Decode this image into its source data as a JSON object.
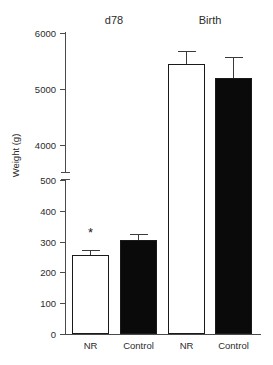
{
  "chart_data": {
    "type": "bar",
    "title": "",
    "xlabel": "",
    "ylabel": "Weight (g)",
    "grid": false,
    "legend": "none",
    "broken_axis": true,
    "axis_segments": [
      {
        "name": "lower",
        "range": [
          0,
          500
        ],
        "ticks": [
          0,
          100,
          200,
          300,
          400,
          500
        ]
      },
      {
        "name": "upper",
        "range": [
          4000,
          6000
        ],
        "ticks": [
          4000,
          5000,
          6000
        ]
      }
    ],
    "ytick_labels_lower": [
      "0",
      "100",
      "200",
      "300",
      "400",
      "500"
    ],
    "ytick_labels_upper": [
      "4000",
      "5000",
      "6000"
    ],
    "groups": [
      "d78",
      "Birth"
    ],
    "categories": [
      "NR",
      "Control",
      "NR",
      "Control"
    ],
    "values": [
      255,
      305,
      5450,
      5230
    ],
    "errors": [
      8,
      12,
      130,
      220
    ],
    "fills": [
      "open",
      "solid",
      "open",
      "solid"
    ],
    "annotations": [
      {
        "label": "*",
        "bar_index": 0
      }
    ]
  },
  "axis": {
    "y_label": "Weight (g)",
    "ticks_upper": [
      {
        "value": "6000",
        "y": 33
      },
      {
        "value": "5000",
        "y": 89
      },
      {
        "value": "4000",
        "y": 145
      }
    ],
    "ticks_lower": [
      {
        "value": "500",
        "y": 180
      },
      {
        "value": "400",
        "y": 211
      },
      {
        "value": "300",
        "y": 242
      },
      {
        "value": "200",
        "y": 272
      },
      {
        "value": "100",
        "y": 303
      },
      {
        "value": "0",
        "y": 334
      }
    ]
  },
  "groups": [
    {
      "label": "d78"
    },
    {
      "label": "Birth"
    }
  ],
  "bars": [
    {
      "category": "NR",
      "group": "d78",
      "value": 255,
      "error": 8,
      "fill": "open",
      "left": 72,
      "width": 37,
      "top": 255,
      "height": 79,
      "err_cap_top": 250,
      "err_cap_bottom": 255,
      "star": "*",
      "star_top": 226
    },
    {
      "category": "Control",
      "group": "d78",
      "value": 305,
      "error": 12,
      "fill": "solid",
      "left": 120,
      "width": 37,
      "top": 240,
      "height": 94,
      "err_cap_top": 234,
      "err_cap_bottom": 240,
      "star": "",
      "star_top": 0
    },
    {
      "category": "NR",
      "group": "Birth",
      "value": 5450,
      "error": 130,
      "fill": "open",
      "left": 168,
      "width": 37,
      "top": 64,
      "height": 270,
      "err_cap_top": 51,
      "err_cap_bottom": 64,
      "star": "",
      "star_top": 0
    },
    {
      "category": "Control",
      "group": "Birth",
      "value": 5230,
      "error": 220,
      "fill": "solid",
      "left": 215,
      "width": 37,
      "top": 78,
      "height": 256,
      "err_cap_top": 57,
      "err_cap_bottom": 78,
      "star": "",
      "star_top": 0
    }
  ]
}
